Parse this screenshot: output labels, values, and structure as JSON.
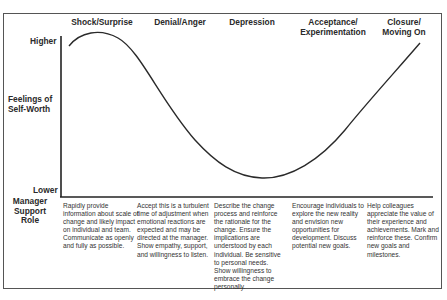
{
  "diagram": {
    "y_axis": {
      "title": "Feelings of\nSelf-Worth",
      "high_label": "Higher",
      "low_label": "Lower"
    },
    "row_label": "Manager\nSupport\nRole",
    "stages": [
      {
        "name": "Shock/Surprise",
        "manager_support": "Rapidly provide information about scale of change and likely impact on individual and team. Communicate as openly and fully as possible."
      },
      {
        "name": "Denial/Anger",
        "manager_support": "Accept this is a turbulent time of adjustment when emotional reactions are expected and may be directed at the manager. Show empathy, support, and willingness to listen."
      },
      {
        "name": "Depression",
        "manager_support": "Describe the change process and reinforce the rationale for the change. Ensure the implications are understood by each individual. Be sensitive to personal needs. Show willingness to embrace the change personally."
      },
      {
        "name": "Acceptance/\nExperimentation",
        "manager_support": "Encourage individuals to explore the new reality and envision new opportunities for development. Discuss potential new goals."
      },
      {
        "name": "Closure/\nMoving On",
        "manager_support": "Help colleagues appreciate the value of their experience and achievements. Mark and reinforce these. Confirm new goals and milestones."
      }
    ],
    "curve_description": "Self-worth starts high, peaks at Shock/Surprise, declines through Denial/Anger to a minimum at Depression, then rises through Acceptance/Experimentation to Closure/Moving On."
  }
}
